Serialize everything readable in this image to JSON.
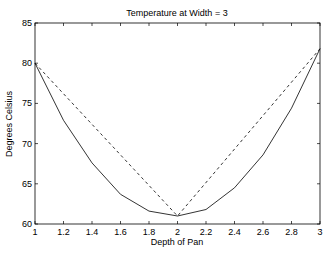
{
  "chart_data": {
    "type": "line",
    "title": "Temperature at Width = 3",
    "xlabel": "Depth of Pan",
    "ylabel": "Degrees Celsius",
    "xlim": [
      1,
      3
    ],
    "ylim": [
      60,
      85
    ],
    "xticks": [
      1,
      1.2,
      1.4,
      1.6,
      1.8,
      2,
      2.2,
      2.4,
      2.6,
      2.8,
      3
    ],
    "xtick_labels": [
      "1",
      "1.2",
      "1.4",
      "1.6",
      "1.8",
      "2",
      "2.2",
      "2.4",
      "2.6",
      "2.8",
      "3"
    ],
    "yticks": [
      60,
      65,
      70,
      75,
      80,
      85
    ],
    "ytick_labels": [
      "60",
      "65",
      "70",
      "75",
      "80",
      "85"
    ],
    "grid": false,
    "legend": null,
    "series": [
      {
        "name": "solid",
        "style": "solid",
        "color": "#000000",
        "x": [
          1,
          1.2,
          1.4,
          1.6,
          1.8,
          2,
          2.2,
          2.4,
          2.6,
          2.8,
          3
        ],
        "y": [
          80,
          72.9,
          67.6,
          63.7,
          61.6,
          61.0,
          61.8,
          64.5,
          68.6,
          74.4,
          81.8
        ]
      },
      {
        "name": "dashed",
        "style": "dashed",
        "color": "#000000",
        "x": [
          1,
          2,
          3
        ],
        "y": [
          80,
          61.0,
          81.8
        ]
      }
    ]
  }
}
